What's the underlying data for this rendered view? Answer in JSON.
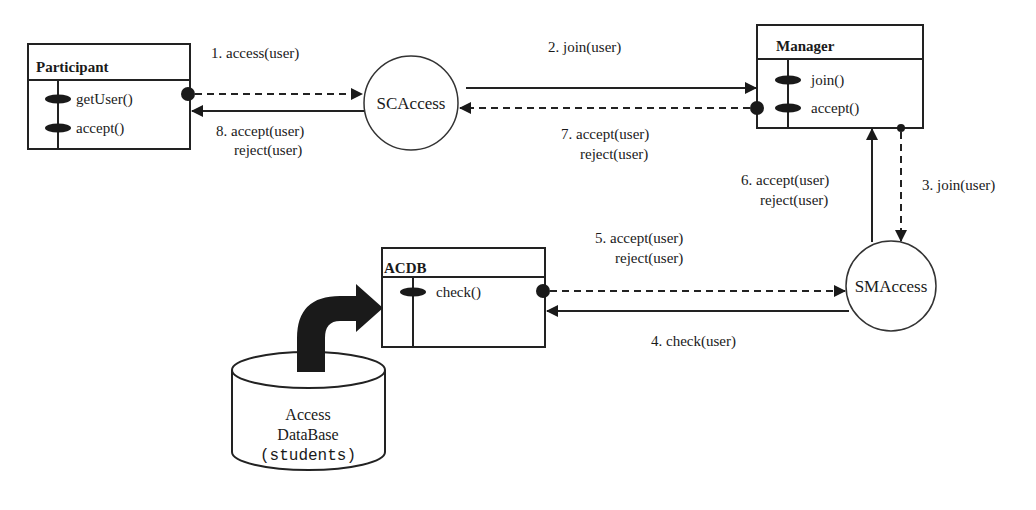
{
  "diagram": {
    "classes": {
      "participant": {
        "name": "Participant",
        "methods": [
          "getUser()",
          "accept()"
        ]
      },
      "manager": {
        "name": "Manager",
        "methods": [
          "join()",
          "accept()"
        ]
      },
      "acdb": {
        "name": "ACDB",
        "methods": [
          "check()"
        ]
      }
    },
    "nodes": {
      "scaccess": "SCAccess",
      "smaccess": "SMAccess"
    },
    "database": {
      "line1": "Access",
      "line2": "DataBase",
      "line3": "(students)"
    },
    "messages": {
      "m1": "1. access(user)",
      "m2": "2. join(user)",
      "m3": "3. join(user)",
      "m4": "4. check(user)",
      "m5_line1": "5. accept(user)",
      "m5_line2": "reject(user)",
      "m6_line1": "6. accept(user)",
      "m6_line2": "reject(user)",
      "m7_line1": "7. accept(user)",
      "m7_line2": "reject(user)",
      "m8_line1": "8. accept(user)",
      "m8_line2": "reject(user)"
    },
    "colors": {
      "ink": "#1a1a1a",
      "background": "#ffffff"
    }
  }
}
